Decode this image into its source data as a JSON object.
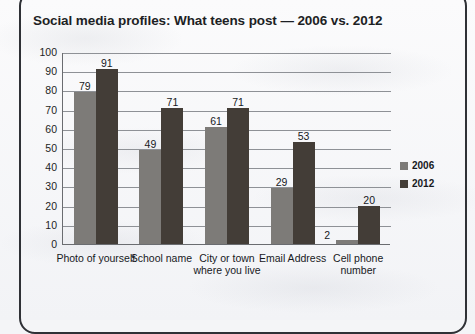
{
  "chart_data": {
    "type": "bar",
    "title": "Social media profiles: What teens post — 2006 vs. 2012",
    "categories": [
      "Photo of yourself",
      "School name",
      "City or town where you live",
      "Email Address",
      "Cell phone number"
    ],
    "series": [
      {
        "name": "2006",
        "values": [
          79,
          49,
          61,
          29,
          2
        ],
        "color": "#7d7b78"
      },
      {
        "name": "2012",
        "values": [
          91,
          71,
          71,
          53,
          20
        ],
        "color": "#433d37"
      }
    ],
    "xlabel": "",
    "ylabel": "",
    "ylim": [
      0,
      100
    ],
    "yticks": [
      "100",
      "90",
      "80",
      "70",
      "60",
      "50",
      "40",
      "30",
      "20",
      "10",
      "0"
    ],
    "grid": true,
    "legend_position": "right"
  }
}
